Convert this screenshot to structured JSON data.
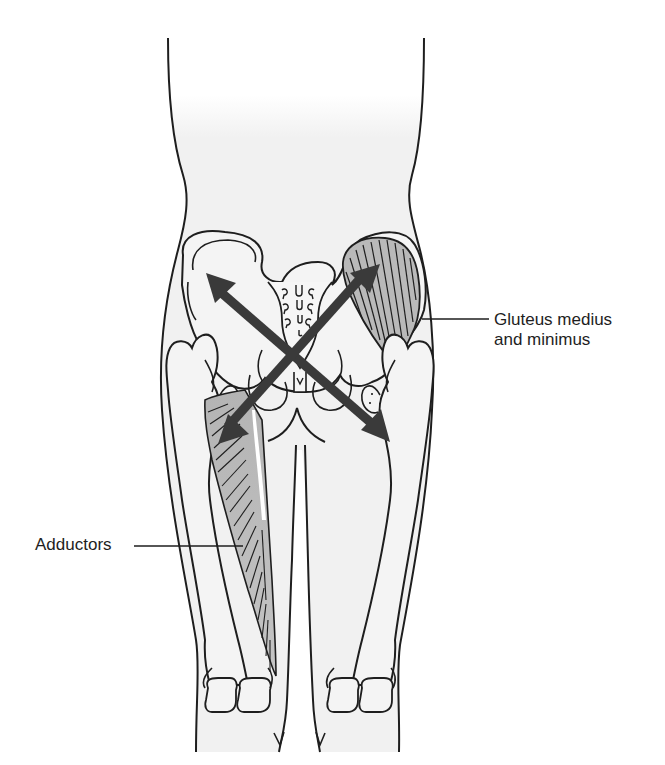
{
  "figure": {
    "colors": {
      "outline": "#1e1e1e",
      "skin_fill": "#f2f2f2",
      "bone_fill": "#f4f4f4",
      "muscle_fill": "#b8b8b8",
      "arrow_fill": "#3a3a3a",
      "background": "#ffffff"
    },
    "arrows": [
      {
        "name": "upper-left to lower-right",
        "from": [
          210,
          276
        ],
        "to": [
          388,
          440
        ]
      },
      {
        "name": "upper-right to lower-left",
        "from": [
          378,
          265
        ],
        "to": [
          220,
          443
        ]
      }
    ]
  },
  "labels": {
    "gluteus_line1": "Gluteus medius",
    "gluteus_line2": "and minimus",
    "adductors": "Adductors"
  }
}
